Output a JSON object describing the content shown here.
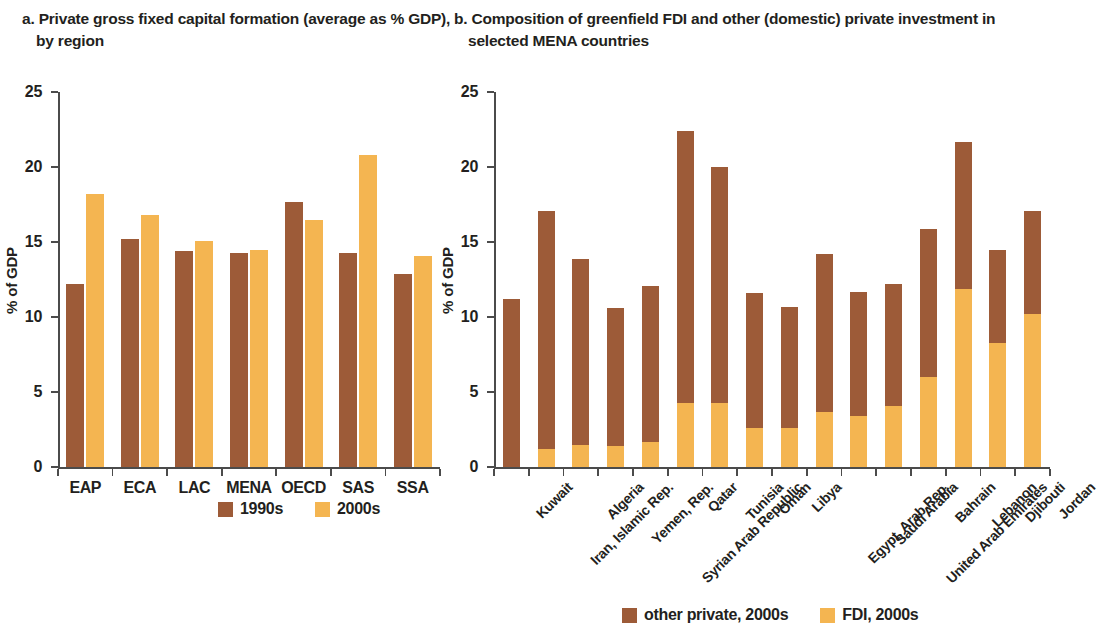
{
  "panel_a": {
    "title": "a. Private gross fixed capital formation (average as % GDP), by region",
    "ylabel": "% of GDP",
    "legend": [
      {
        "label": "1990s",
        "color": "#9D5B38"
      },
      {
        "label": "2000s",
        "color": "#F4B551"
      }
    ]
  },
  "panel_b": {
    "title": "b. Composition of greenfield FDI and other (domestic) private investment in selected MENA countries",
    "ylabel": "% of GDP",
    "legend": [
      {
        "label": "other private, 2000s",
        "color": "#9D5B38"
      },
      {
        "label": "FDI, 2000s",
        "color": "#F4B551"
      }
    ]
  },
  "chart_data": [
    {
      "type": "bar",
      "id": "panel-a",
      "title": "a. Private gross fixed capital formation (average as % GDP), by region",
      "xlabel": "",
      "ylabel": "% of GDP",
      "ylim": [
        0,
        25
      ],
      "yticks": [
        0,
        5,
        10,
        15,
        20,
        25
      ],
      "grid": false,
      "legend_position": "bottom",
      "grouping": "grouped",
      "categories": [
        "EAP",
        "ECA",
        "LAC",
        "MENA",
        "OECD",
        "SAS",
        "SSA"
      ],
      "series": [
        {
          "name": "1990s",
          "color": "#9D5B38",
          "values": [
            12.2,
            15.2,
            14.4,
            14.3,
            17.7,
            14.3,
            12.9
          ]
        },
        {
          "name": "2000s",
          "color": "#F4B551",
          "values": [
            18.2,
            16.8,
            15.1,
            14.5,
            16.5,
            20.8,
            14.1
          ]
        }
      ]
    },
    {
      "type": "bar",
      "id": "panel-b",
      "title": "b. Composition of greenfield FDI and other (domestic) private investment in selected MENA countries",
      "xlabel": "",
      "ylabel": "% of GDP",
      "ylim": [
        0,
        25
      ],
      "yticks": [
        0,
        5,
        10,
        15,
        20,
        25
      ],
      "grid": false,
      "legend_position": "bottom",
      "grouping": "stacked",
      "categories": [
        "Kuwait",
        "Iran, Islamic Rep.",
        "Algeria",
        "Yemen, Rep.",
        "Syrian Arab Republic",
        "Qatar",
        "Tunisia",
        "Oman",
        "Libya",
        "Egypt, Arab Rep.",
        "Saudi Arabia",
        "United Arab Emirates",
        "Bahrain",
        "Lebanon",
        "Djibouti",
        "Jordan"
      ],
      "series": [
        {
          "name": "FDI, 2000s",
          "color": "#F4B551",
          "values": [
            0.0,
            1.2,
            1.5,
            1.4,
            1.7,
            4.3,
            4.3,
            2.6,
            2.6,
            3.7,
            3.4,
            4.1,
            6.0,
            11.9,
            8.3,
            10.2
          ]
        },
        {
          "name": "other private, 2000s",
          "color": "#9D5B38",
          "values": [
            11.2,
            15.9,
            12.4,
            9.2,
            10.4,
            18.1,
            15.7,
            9.0,
            8.1,
            10.5,
            8.3,
            8.1,
            9.9,
            9.8,
            6.2,
            6.9
          ]
        }
      ],
      "totals": [
        11.2,
        17.1,
        13.9,
        10.6,
        12.1,
        22.4,
        20.0,
        11.6,
        10.7,
        14.2,
        11.7,
        12.2,
        15.9,
        21.7,
        14.5,
        17.1
      ]
    }
  ]
}
